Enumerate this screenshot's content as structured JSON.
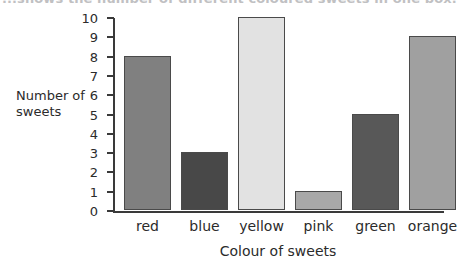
{
  "page": {
    "top_caption": "...shows the number of different coloured sweets in one box."
  },
  "chart_data": {
    "type": "bar",
    "title": "",
    "xlabel": "Colour of sweets",
    "ylabel": "Number of sweets",
    "ylabel_lines": [
      "Number of",
      "sweets"
    ],
    "categories": [
      "red",
      "blue",
      "yellow",
      "pink",
      "green",
      "orange"
    ],
    "values": [
      8,
      3,
      10,
      1,
      5,
      9
    ],
    "ylim": [
      0,
      10
    ],
    "ytick_labels": [
      "0",
      "1",
      "2",
      "3",
      "4",
      "5",
      "6",
      "7",
      "8",
      "9",
      "10"
    ],
    "ytick_values": [
      0,
      1,
      2,
      3,
      4,
      5,
      6,
      7,
      8,
      9,
      10
    ],
    "grid": false,
    "legend": null,
    "bar_colors": [
      "#808080",
      "#484848",
      "#e2e2e2",
      "#a8a8a8",
      "#585858",
      "#a0a0a0"
    ],
    "bar_edge_color": "#4a4a4a",
    "axis_color": "#3a3a3a",
    "background": "#ffffff"
  }
}
